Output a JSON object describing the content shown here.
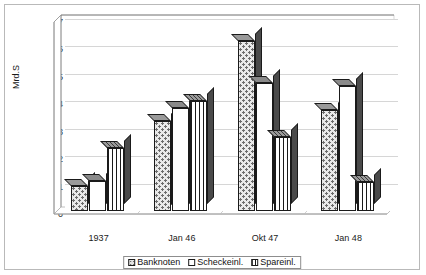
{
  "chart_data": {
    "type": "bar",
    "title": "",
    "xlabel": "",
    "ylabel": "Mrd.S",
    "ylim": [
      0,
      7
    ],
    "ytick_step": 1,
    "grid": true,
    "legend_position": "bottom",
    "style": "3d-clustered-column",
    "categories": [
      "1937",
      "Jan 46",
      "Okt 47",
      "Jan 48"
    ],
    "yticks": [
      "0",
      "1",
      "2",
      "3",
      "4",
      "5",
      "6",
      "7"
    ],
    "series": [
      {
        "name": "Banknoten",
        "pattern": "dotted",
        "values": [
          0.9,
          3.3,
          6.2,
          3.7
        ]
      },
      {
        "name": "Scheckeinl.",
        "pattern": "solid-white",
        "values": [
          1.1,
          3.75,
          4.65,
          4.55
        ]
      },
      {
        "name": "Spareinl.",
        "pattern": "vertical-stripes",
        "values": [
          2.3,
          4.0,
          2.7,
          1.05
        ]
      }
    ]
  },
  "colors": {
    "bar_outline": "#1a1a1a",
    "bar_side": "#4a4a4a",
    "bar_top": "#7d7d7d",
    "gridline": "#d6d6d6",
    "axis": "#9a9a9a",
    "frame": "#b9b9b9",
    "background": "#ffffff",
    "text": "#1a1a1a"
  },
  "legend": {
    "items": [
      {
        "label": "Banknoten"
      },
      {
        "label": "Scheckeinl."
      },
      {
        "label": "Spareinl."
      }
    ]
  }
}
